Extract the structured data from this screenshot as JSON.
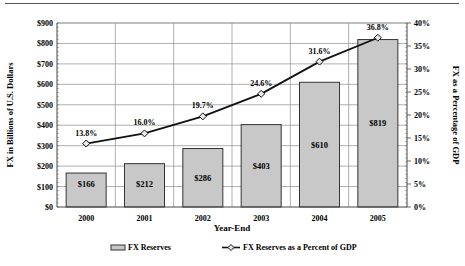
{
  "chart_data": {
    "type": "bar+line",
    "title": "",
    "xlabel": "Year-End",
    "ylabel": "FX in Billions of U.S. Dollars",
    "y2label": "FX as a Percentage of GDP",
    "categories": [
      "2000",
      "2001",
      "2002",
      "2003",
      "2004",
      "2005"
    ],
    "series": [
      {
        "name": "FX Reserves",
        "type": "bar",
        "axis": "left",
        "values": [
          166,
          212,
          286,
          403,
          610,
          819
        ],
        "labels": [
          "$166",
          "$212",
          "$286",
          "$403",
          "$610",
          "$819"
        ]
      },
      {
        "name": "FX Reserves as a Percent of GDP",
        "type": "line",
        "axis": "right",
        "values": [
          13.8,
          16.0,
          19.7,
          24.6,
          31.6,
          36.8
        ],
        "labels": [
          "13.8%",
          "16.0%",
          "19.7%",
          "24.6%",
          "31.6%",
          "36.8%"
        ]
      }
    ],
    "ylim": [
      0,
      900
    ],
    "y2lim": [
      0,
      40
    ],
    "yticks": [
      "$0",
      "$100",
      "$200",
      "$300",
      "$400",
      "$500",
      "$600",
      "$700",
      "$800",
      "$900"
    ],
    "y2ticks": [
      "0%",
      "5%",
      "10%",
      "15%",
      "20%",
      "25%",
      "30%",
      "35%",
      "40%"
    ],
    "grid": true,
    "legend_position": "bottom",
    "colors": {
      "bar_fill": "#c8c8c8",
      "bar_stroke": "#333333",
      "line": "#111111",
      "marker_fill": "#e8e8e8",
      "grid": "#9a9a9a"
    }
  },
  "legend": {
    "bar_label": "FX Reserves",
    "line_label": "FX Reserves as a Percent of GDP"
  }
}
